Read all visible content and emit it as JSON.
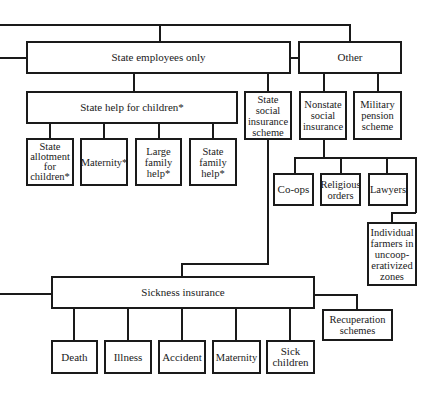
{
  "diagram": {
    "type": "organizational-tree",
    "nodes": {
      "state_employees": "State employees only",
      "other": "Other",
      "state_help_children": "State help for children*",
      "state_social_insurance": "State\nsocial\ninsurance\nscheme",
      "nonstate_social_insurance": "Nonstate\nsocial\ninsurance",
      "military_pension": "Military\npension\nscheme",
      "state_allotment": "State\nallotment\nfor\nchildren*",
      "maternity_child": "Maternity*",
      "large_family": "Large\nfamily\nhelp*",
      "state_family": "State\nfamily\nhelp*",
      "coops": "Co-ops",
      "religious": "Religious\norders",
      "lawyers": "Lawyers",
      "individual_farmers": "Individual\nfarmers in\nuncoop-\nerativized\nzones",
      "sickness": "Sickness insurance",
      "recuperation": "Recuperation\nschemes",
      "death": "Death",
      "illness": "Illness",
      "accident": "Accident",
      "maternity": "Maternity",
      "sick_children": "Sick\nchildren"
    }
  }
}
